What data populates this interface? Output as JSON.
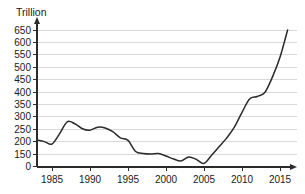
{
  "chart_data": {
    "type": "line",
    "title": "",
    "title_clipped": "",
    "xlabel": "",
    "ylabel": "Trillion",
    "unit_label": "Trillion",
    "grid": true,
    "legend": "none",
    "xlim": [
      1983,
      2016
    ],
    "ylim": [
      100,
      650
    ],
    "y_axis_break": true,
    "y_break_note": "axis jumps from 0 to 150",
    "ytick_labels": [
      "650",
      "600",
      "550",
      "500",
      "450",
      "400",
      "350",
      "300",
      "250",
      "200",
      "150",
      "0"
    ],
    "ytick_values": [
      650,
      600,
      550,
      500,
      450,
      400,
      350,
      300,
      250,
      200,
      150,
      0
    ],
    "xtick_labels": [
      "1985",
      "1990",
      "1995",
      "2000",
      "2005",
      "2010",
      "2015"
    ],
    "xtick_values": [
      1985,
      1990,
      1995,
      2000,
      2005,
      2010,
      2015
    ],
    "series": [
      {
        "name": "value",
        "color": "#2b2b2b",
        "x": [
          1983,
          1984,
          1985,
          1986,
          1987,
          1988,
          1989,
          1990,
          1991,
          1992,
          1993,
          1994,
          1995,
          1996,
          1997,
          1998,
          1999,
          2000,
          2001,
          2002,
          2003,
          2004,
          2005,
          2006,
          2007,
          2008,
          2009,
          2010,
          2011,
          2012,
          2013,
          2014,
          2015,
          2016
        ],
        "values": [
          207,
          200,
          190,
          232,
          280,
          272,
          252,
          246,
          258,
          255,
          240,
          215,
          205,
          160,
          152,
          150,
          152,
          142,
          130,
          122,
          138,
          128,
          112,
          145,
          180,
          215,
          258,
          318,
          372,
          382,
          398,
          460,
          540,
          650
        ]
      }
    ]
  }
}
